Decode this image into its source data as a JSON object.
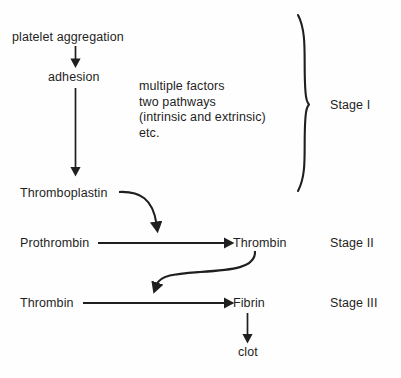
{
  "diagram": {
    "ink_color": "#1f1f1f",
    "background_color": "#fefefe",
    "nodes": [
      {
        "id": "platelet_aggregation",
        "label": "platelet aggregation"
      },
      {
        "id": "adhesion",
        "label": "adhesion"
      },
      {
        "id": "thromboplastin",
        "label": "Thromboplastin"
      },
      {
        "id": "prothrombin",
        "label": "Prothrombin"
      },
      {
        "id": "thrombin_stage2",
        "label": "Thrombin"
      },
      {
        "id": "thrombin_stage3",
        "label": "Thrombin"
      },
      {
        "id": "fibrin",
        "label": "Fibrin"
      },
      {
        "id": "clot",
        "label": "clot"
      }
    ],
    "annotation": {
      "id": "factors_note",
      "lines": [
        "multiple factors",
        "two pathways",
        "(intrinsic and extrinsic)",
        "etc."
      ],
      "text": "multiple factors\ntwo pathways\n(intrinsic and extrinsic)\netc."
    },
    "stages": [
      {
        "id": "stage_1",
        "label": "Stage I",
        "braced": true
      },
      {
        "id": "stage_2",
        "label": "Stage II",
        "braced": false
      },
      {
        "id": "stage_3",
        "label": "Stage III",
        "braced": false
      }
    ],
    "edges": [
      {
        "from": "platelet_aggregation",
        "to": "adhesion",
        "kind": "straight-down"
      },
      {
        "from": "adhesion",
        "to": "thromboplastin",
        "kind": "straight-down-long"
      },
      {
        "from": "thromboplastin",
        "to": "prothrombin_reaction",
        "kind": "curved"
      },
      {
        "from": "prothrombin",
        "to": "thrombin_stage2",
        "kind": "straight-right"
      },
      {
        "from": "thrombin_stage2",
        "to": "thrombin_stage3_reaction",
        "kind": "curved-s"
      },
      {
        "from": "thrombin_stage3",
        "to": "fibrin",
        "kind": "straight-right"
      },
      {
        "from": "fibrin",
        "to": "clot",
        "kind": "straight-down"
      }
    ]
  }
}
